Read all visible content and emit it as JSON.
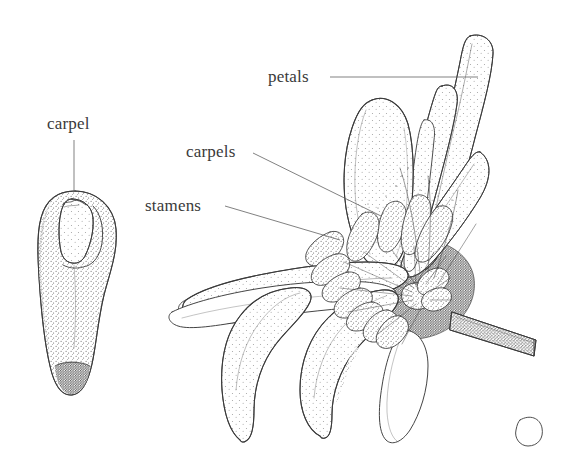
{
  "figure": {
    "kind": "botanical-line-illustration",
    "background_color": "#ffffff",
    "ink_color": "#3a3a3a",
    "stipple_color": "#555555",
    "width": 579,
    "height": 469
  },
  "labels": [
    {
      "id": "carpel",
      "text": "carpel",
      "x": 47,
      "y": 115,
      "leader": {
        "type": "vertical",
        "x1": 74,
        "y1": 140,
        "x2": 74,
        "y2": 191
      }
    },
    {
      "id": "petals",
      "text": "petals",
      "x": 268,
      "y": 68,
      "leader": {
        "type": "horizontal",
        "x1": 330,
        "y1": 77,
        "x2": 478,
        "y2": 77
      }
    },
    {
      "id": "carpels",
      "text": "carpels",
      "x": 186,
      "y": 143,
      "leader": {
        "type": "diagonal",
        "x1": 253,
        "y1": 153,
        "x2": 381,
        "y2": 216
      }
    },
    {
      "id": "stamens",
      "text": "stamens",
      "x": 145,
      "y": 197,
      "leader": {
        "type": "diagonal",
        "x1": 225,
        "y1": 206,
        "x2": 340,
        "y2": 240
      }
    }
  ],
  "parts": {
    "carpel_detail": {
      "name": "carpel",
      "bbox": [
        35,
        190,
        80,
        205
      ],
      "description": "pear-shaped stippled carpel with inner ovule outline at apex and dark stippled base"
    },
    "flower": {
      "name": "flower",
      "bbox": [
        170,
        30,
        409,
        439
      ],
      "center": [
        420,
        287
      ],
      "description": "open flower, clavate stamens and carpels in spiral at center, strap petals radiating outward, dark pedicel to lower right"
    }
  },
  "counts": {
    "labels": 4,
    "drawings": 2
  }
}
